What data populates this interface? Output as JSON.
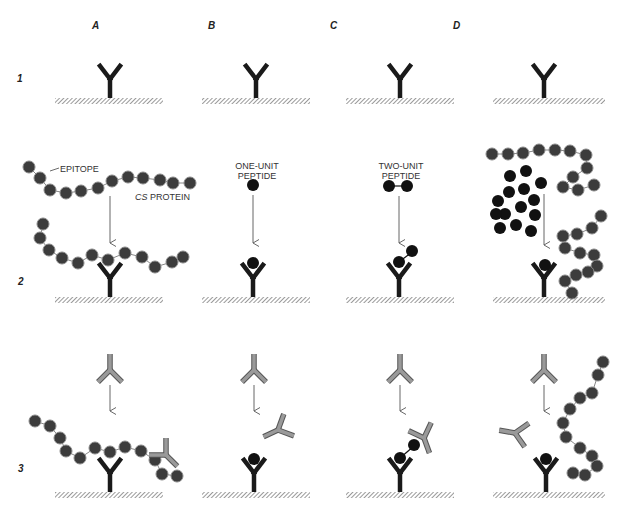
{
  "columns": [
    {
      "id": "A",
      "label": "A"
    },
    {
      "id": "B",
      "label": "B"
    },
    {
      "id": "C",
      "label": "C"
    },
    {
      "id": "D",
      "label": "D"
    }
  ],
  "rows": [
    {
      "id": "1",
      "label": "1"
    },
    {
      "id": "2",
      "label": "2"
    },
    {
      "id": "3",
      "label": "3"
    }
  ],
  "annotations": {
    "epitope": "EPITOPE",
    "cs_protein_italic": "CS",
    "cs_protein_rest": " PROTEIN",
    "one_unit_line1": "ONE-UNIT",
    "one_unit_line2": "PEPTIDE",
    "two_unit_line1": "TWO-UNIT",
    "two_unit_line2": "PEPTIDE"
  },
  "colors": {
    "antibody_bound": "#1a1a1a",
    "antibody_free": "#8a8a8a",
    "bead_protein": "#3c3c3c",
    "bead_peptide": "#111111",
    "surface_hatch": "#555555",
    "arrow": "#555555"
  },
  "legend_meaning": {
    "black_Y": "immobilized antibody on surface",
    "gray_Y": "free labeled antibody",
    "gray_chain": "CS protein (repeating epitope units)",
    "black_dot": "peptide"
  }
}
